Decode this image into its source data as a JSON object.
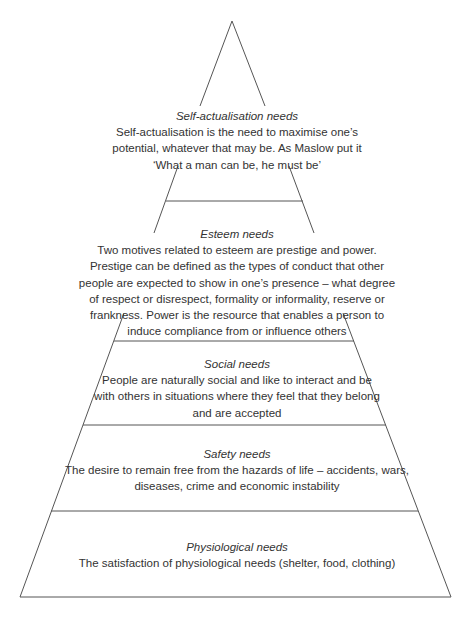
{
  "diagram": {
    "type": "pyramid",
    "stroke_color": "#555555",
    "text_color": "#333333",
    "levels": [
      {
        "id": "self-actualisation",
        "title": "Self-actualisation needs",
        "body_lines": [
          "Self-actualisation is the need to maximise one’s",
          "potential, whatever that may be.  As Maslow put it",
          "‘What a man can be, he must be’"
        ]
      },
      {
        "id": "esteem",
        "title": "Esteem needs",
        "body_lines": [
          "Two motives related to esteem are prestige and power.",
          "Prestige can be defined as the types of conduct that other",
          "people are expected to show in one’s presence – what degree",
          "of respect or disrespect, formality or informality, reserve or",
          "frankness.  Power is the resource that enables a person to",
          "induce compliance from or influence others"
        ]
      },
      {
        "id": "social",
        "title": "Social needs",
        "body_lines": [
          "People are naturally social and like to interact and be",
          "with others in situations where they feel that they belong",
          "and are accepted"
        ]
      },
      {
        "id": "safety",
        "title": "Safety needs",
        "body_lines": [
          "The desire to remain free from the hazards of life – accidents, wars,",
          "diseases, crime and economic instability"
        ]
      },
      {
        "id": "physiological",
        "title": "Physiological needs",
        "body_lines": [
          "The satisfaction of physiological needs (shelter, food, clothing)"
        ]
      }
    ]
  }
}
